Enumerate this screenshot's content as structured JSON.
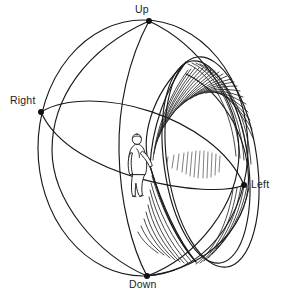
{
  "diagram": {
    "background_color": "#ffffff",
    "ink_color": "#1a1a1a",
    "width": 284,
    "height": 297,
    "labels": {
      "up": "Up",
      "down": "Down",
      "right": "Right",
      "left": "Left"
    },
    "pole_points": [
      {
        "name": "up",
        "label": "Up",
        "x": 149,
        "y": 21
      },
      {
        "name": "down",
        "label": "Down",
        "x": 147,
        "y": 276
      },
      {
        "name": "right",
        "label": "Right",
        "x": 41,
        "y": 112
      },
      {
        "name": "left",
        "label": "Left",
        "x": 244,
        "y": 185
      }
    ],
    "sphere": {
      "center_x": 143,
      "center_y": 148,
      "radius_x": 105,
      "radius_y": 128,
      "great_circles": [
        {
          "name": "outer-sphere-outline",
          "type": "circle"
        },
        {
          "name": "vertical-meridian",
          "type": "ellipse"
        },
        {
          "name": "horizontal-equator",
          "type": "ellipse"
        },
        {
          "name": "oblique-meridian",
          "type": "ellipse"
        }
      ]
    },
    "cone": {
      "name": "view-cone",
      "apex_x": 150,
      "apex_y": 166,
      "rim_center_x": 214,
      "rim_center_y": 160,
      "rim_radius_x": 43,
      "rim_radius_y": 106,
      "hatch_line_count": 26
    },
    "human_figure": {
      "name": "standing-person",
      "x": 133,
      "y": 134,
      "height": 62,
      "pose": "standing, arm extended toward cone apex"
    }
  }
}
